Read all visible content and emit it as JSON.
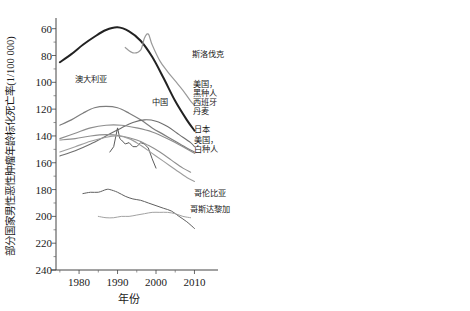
{
  "figure": {
    "title": "",
    "panels": [
      "male",
      "female"
    ]
  },
  "panel_male": {
    "ylabel": "部分国家男性恶性肿瘤年龄标化死亡率(1/100 000)",
    "xlabel": "年份",
    "yticks": [
      "240",
      "220",
      "200",
      "180",
      "160",
      "140",
      "120",
      "100",
      "80",
      "60"
    ],
    "xticks": [
      "1980",
      "1990",
      "2000",
      "2010"
    ],
    "labels": {
      "slovakia": "斯洛伐克",
      "usa_black_1": "美国，",
      "usa_black_2": "黑种人",
      "spain": "西班牙",
      "denmark": "丹麦",
      "japan": "日本",
      "usa_white_1": "美国，",
      "usa_white_2": "白种人",
      "colombia": "哥伦比亚",
      "costa_rica": "哥斯达黎加",
      "australia": "澳大利亚",
      "china": "中国"
    }
  },
  "panel_female": {
    "ylabel": "部分国家女性恶性肿瘤年龄标化死亡率(1/100 000)",
    "xlabel": "年份",
    "yticks": [
      "240",
      "220",
      "200",
      "180",
      "160",
      "140",
      "120",
      "100",
      "80",
      "60"
    ],
    "xticks": [
      "1980",
      "1990",
      "2000",
      "2010"
    ],
    "labels": {
      "denmark": "丹麦",
      "usa_black_1": "美国，",
      "usa_black_2": "黑种人",
      "slovakia": "斯洛伐克",
      "usa_white_1": "美国，",
      "usa_white_2": "白种人",
      "australia_1": "澳大",
      "australia_2": "利亚",
      "colombia": "哥伦比亚",
      "costa_rica": "哥斯达黎加",
      "spain": "西班牙",
      "japan": "日本",
      "china": "中国"
    }
  },
  "chart_data": [
    {
      "type": "line",
      "id": "male",
      "title": "部分国家男性恶性肿瘤年龄标化死亡率",
      "xlabel": "年份",
      "ylabel": "部分国家男性恶性肿瘤年龄标化死亡率(1/100 000)",
      "xlim": [
        1974,
        2013
      ],
      "ylim": [
        60,
        245
      ],
      "yticks": [
        60,
        80,
        100,
        120,
        140,
        160,
        180,
        200,
        220,
        240
      ],
      "xticks": [
        1980,
        1990,
        2000,
        2010
      ],
      "grid": false,
      "legend": "inline-right-labels",
      "series": [
        {
          "name": "美国，黑种人",
          "color": "#222222",
          "width": 2.0,
          "x": [
            1975,
            1978,
            1981,
            1984,
            1987,
            1990,
            1993,
            1996,
            1999,
            2002,
            2005,
            2008,
            2010
          ],
          "y": [
            215,
            221,
            228,
            234,
            239,
            241,
            238,
            231,
            219,
            203,
            186,
            172,
            164
          ]
        },
        {
          "name": "斯洛伐克",
          "color": "#9a9a9a",
          "width": 1.2,
          "x": [
            1992,
            1994,
            1996,
            1997,
            1998,
            1999,
            2001,
            2003,
            2005,
            2007,
            2009,
            2010
          ],
          "y": [
            226,
            222,
            224,
            233,
            236,
            228,
            216,
            208,
            201,
            194,
            186,
            183
          ]
        },
        {
          "name": "澳大利亚",
          "color": "#7d7d7d",
          "width": 1.2,
          "x": [
            1975,
            1978,
            1981,
            1984,
            1987,
            1990,
            1993,
            1996,
            1999,
            2002,
            2005,
            2008,
            2010
          ],
          "y": [
            168,
            172,
            177,
            181,
            182,
            181,
            177,
            172,
            166,
            161,
            156,
            151,
            148
          ]
        },
        {
          "name": "西班牙",
          "color": "#6e6e6e",
          "width": 1.1,
          "x": [
            1975,
            1979,
            1983,
            1987,
            1991,
            1994,
            1997,
            2000,
            2003,
            2006,
            2009,
            2010
          ],
          "y": [
            145,
            149,
            154,
            160,
            166,
            170,
            172,
            171,
            167,
            161,
            155,
            152
          ]
        },
        {
          "name": "丹麦",
          "color": "#8d8d8d",
          "width": 1.1,
          "x": [
            1975,
            1979,
            1983,
            1987,
            1991,
            1995,
            1999,
            2003,
            2007,
            2010
          ],
          "y": [
            158,
            162,
            166,
            168,
            168,
            166,
            163,
            158,
            152,
            147
          ]
        },
        {
          "name": "中国",
          "color": "#5a5a5a",
          "width": 1.0,
          "x": [
            1988,
            1989,
            1990,
            1990.6,
            1991,
            1992,
            1993,
            1994,
            1995,
            1996,
            1997,
            1998,
            1999,
            2000
          ],
          "y": [
            148,
            152,
            166,
            158,
            157,
            154,
            155,
            152,
            152,
            155,
            154,
            151,
            143,
            136
          ]
        },
        {
          "name": "日本",
          "color": "#8f8f8f",
          "width": 1.1,
          "x": [
            1975,
            1979,
            1983,
            1987,
            1991,
            1995,
            1998,
            2001,
            2004,
            2007,
            2009
          ],
          "y": [
            157,
            158,
            160,
            161,
            160,
            157,
            153,
            148,
            142,
            136,
            133
          ]
        },
        {
          "name": "美国，白种人",
          "color": "#9e9e9e",
          "width": 1.1,
          "x": [
            1975,
            1979,
            1983,
            1987,
            1990,
            1993,
            1996,
            1999,
            2002,
            2005,
            2008,
            2010
          ],
          "y": [
            148,
            152,
            156,
            159,
            160,
            158,
            153,
            147,
            141,
            135,
            129,
            126
          ]
        },
        {
          "name": "哥斯达黎加",
          "color": "#5f5f5f",
          "width": 1.0,
          "x": [
            1981,
            1983,
            1985,
            1987,
            1988,
            1990,
            1992,
            1994,
            1996,
            1998,
            2000,
            2002,
            2004,
            2006,
            2008,
            2010
          ],
          "y": [
            117,
            118,
            118,
            120,
            120,
            118,
            115,
            113,
            112,
            110,
            108,
            106,
            104,
            100,
            96,
            91
          ]
        },
        {
          "name": "哥伦比亚",
          "color": "#a2a2a2",
          "width": 1.0,
          "x": [
            1985,
            1987,
            1989,
            1991,
            1993,
            1995,
            1997,
            1999,
            2001,
            2003,
            2005,
            2007,
            2009
          ],
          "y": [
            100,
            99,
            99,
            100,
            100,
            101,
            102,
            103,
            103,
            103,
            102,
            100,
            99
          ]
        }
      ]
    },
    {
      "type": "line",
      "id": "female",
      "title": "部分国家女性恶性肿瘤年龄标化死亡率",
      "xlabel": "年份",
      "ylabel": "部分国家女性恶性肿瘤年龄标化死亡率(1/100 000)",
      "xlim": [
        1974,
        2013
      ],
      "ylim": [
        60,
        245
      ],
      "yticks": [
        60,
        80,
        100,
        120,
        140,
        160,
        180,
        200,
        220,
        240
      ],
      "xticks": [
        1980,
        1990,
        2000,
        2010
      ],
      "grid": false,
      "legend": "inline-right-labels",
      "series": [
        {
          "name": "丹麦",
          "color": "#7d7d7d",
          "width": 1.3,
          "x": [
            1975,
            1979,
            1983,
            1987,
            1991,
            1994,
            1997,
            2000,
            2003,
            2006,
            2009,
            2010
          ],
          "y": [
            133,
            136,
            138,
            139,
            140,
            140,
            138,
            134,
            128,
            120,
            112,
            109
          ]
        },
        {
          "name": "美国，黑种人",
          "color": "#222222",
          "width": 2.0,
          "x": [
            1975,
            1979,
            1983,
            1987,
            1991,
            1994,
            1997,
            2000,
            2003,
            2006,
            2009,
            2010
          ],
          "y": [
            121,
            126,
            130,
            133,
            134,
            133,
            130,
            125,
            119,
            113,
            107,
            105
          ]
        },
        {
          "name": "斯洛伐克",
          "color": "#9a9a9a",
          "width": 1.1,
          "x": [
            1985,
            1988,
            1991,
            1993,
            1995,
            1997,
            1998,
            1999,
            2001,
            2003,
            2005,
            2007,
            2009,
            2010
          ],
          "y": [
            107,
            108,
            107,
            106,
            105,
            106,
            109,
            108,
            104,
            100,
            97,
            95,
            93,
            92
          ]
        },
        {
          "name": "美国，白种人",
          "color": "#6e6e6e",
          "width": 1.1,
          "x": [
            1985,
            1988,
            1990,
            1992,
            1994,
            1996,
            1998,
            2000,
            2002,
            2004,
            2006,
            2008,
            2010
          ],
          "y": [
            108,
            109,
            108,
            107,
            106,
            104,
            102,
            99,
            96,
            94,
            92,
            90,
            89
          ]
        },
        {
          "name": "澳大利亚",
          "color": "#8d8d8d",
          "width": 1.1,
          "x": [
            1975,
            1979,
            1983,
            1986,
            1989,
            1992,
            1995,
            1998,
            2001,
            2004,
            2007,
            2010
          ],
          "y": [
            99,
            100,
            101,
            102,
            101,
            99,
            97,
            95,
            92,
            90,
            88,
            86
          ]
        },
        {
          "name": "中国",
          "color": "#5a5a5a",
          "width": 1.0,
          "x": [
            1988,
            1989,
            1990,
            1991,
            1992,
            1993,
            1994,
            1995,
            1995.6,
            1996,
            1997,
            1998,
            1999,
            2000,
            2001,
            2003,
            2005,
            2007,
            2008
          ],
          "y": [
            98,
            95,
            92,
            89,
            88,
            88,
            87,
            85,
            79,
            85,
            87,
            87,
            85,
            82,
            79,
            75,
            72,
            69,
            68
          ]
        },
        {
          "name": "哥伦比亚",
          "color": "#a2a2a2",
          "width": 1.0,
          "x": [
            1975,
            1980,
            1985,
            1990,
            1994,
            1998,
            2002,
            2006,
            2009
          ],
          "y": [
            88,
            87,
            85,
            83,
            81,
            79,
            78,
            77,
            76
          ]
        },
        {
          "name": "哥斯达黎加",
          "color": "#949494",
          "width": 1.0,
          "x": [
            1975,
            1980,
            1985,
            1990,
            1994,
            1998,
            2002,
            2006,
            2009
          ],
          "y": [
            86,
            85,
            83,
            81,
            79,
            77,
            75,
            73,
            71
          ]
        },
        {
          "name": "西班牙",
          "color": "#9e9e9e",
          "width": 1.0,
          "x": [
            1985,
            1989,
            1993,
            1996,
            1999,
            2002,
            2005,
            2008,
            2010
          ],
          "y": [
            88,
            86,
            84,
            82,
            80,
            77,
            74,
            71,
            70
          ]
        },
        {
          "name": "日本",
          "color": "#8f8f8f",
          "width": 1.0,
          "x": [
            1985,
            1989,
            1993,
            1996,
            1999,
            2002,
            2005,
            2008,
            2010
          ],
          "y": [
            86,
            84,
            82,
            80,
            78,
            75,
            72,
            69,
            68
          ]
        }
      ]
    }
  ]
}
